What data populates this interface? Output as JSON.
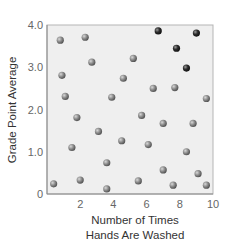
{
  "chart_data": {
    "type": "scatter",
    "title": "",
    "xlabel": "Number of Times Hands Are Washed",
    "xlabel_lines": [
      "Number of Times",
      "Hands Are Washed"
    ],
    "ylabel": "Grade Point Average",
    "xlim": [
      0,
      10
    ],
    "ylim": [
      0,
      4.0
    ],
    "x_ticks": [
      2,
      4,
      6,
      8,
      10
    ],
    "x_tick_labels": [
      "2",
      "4",
      "6",
      "8",
      "10"
    ],
    "y_ticks": [
      0,
      1.0,
      2.0,
      3.0,
      4.0
    ],
    "y_tick_labels": [
      "0",
      "1.0",
      "2.0",
      "3.0",
      "4.0"
    ],
    "grid": false,
    "legend": null,
    "colors": {
      "point": "#8a8a8a",
      "highlight_point": "#2e2e2e",
      "plot_background": "#efefef",
      "frame": "#b5b5b5"
    },
    "series": [
      {
        "name": "students",
        "points": [
          {
            "x": 0.8,
            "y": 3.64
          },
          {
            "x": 2.3,
            "y": 3.71
          },
          {
            "x": 2.7,
            "y": 3.12
          },
          {
            "x": 0.9,
            "y": 2.81
          },
          {
            "x": 5.2,
            "y": 3.21
          },
          {
            "x": 4.6,
            "y": 2.74
          },
          {
            "x": 6.4,
            "y": 2.5
          },
          {
            "x": 7.7,
            "y": 2.52
          },
          {
            "x": 1.1,
            "y": 2.31
          },
          {
            "x": 3.9,
            "y": 2.29
          },
          {
            "x": 1.8,
            "y": 1.81
          },
          {
            "x": 3.1,
            "y": 1.48
          },
          {
            "x": 4.5,
            "y": 1.26
          },
          {
            "x": 1.5,
            "y": 1.1
          },
          {
            "x": 3.6,
            "y": 0.74
          },
          {
            "x": 9.6,
            "y": 2.26
          },
          {
            "x": 5.7,
            "y": 1.86
          },
          {
            "x": 7.0,
            "y": 1.67
          },
          {
            "x": 8.8,
            "y": 1.67
          },
          {
            "x": 6.1,
            "y": 1.17
          },
          {
            "x": 8.4,
            "y": 1.0
          },
          {
            "x": 7.0,
            "y": 0.57
          },
          {
            "x": 9.1,
            "y": 0.48
          },
          {
            "x": 5.5,
            "y": 0.31
          },
          {
            "x": 7.6,
            "y": 0.21
          },
          {
            "x": 9.6,
            "y": 0.21
          },
          {
            "x": 0.4,
            "y": 0.24
          },
          {
            "x": 2.0,
            "y": 0.33
          },
          {
            "x": 3.6,
            "y": 0.12
          }
        ]
      },
      {
        "name": "highlighted",
        "points": [
          {
            "x": 6.7,
            "y": 3.86
          },
          {
            "x": 9.0,
            "y": 3.81
          },
          {
            "x": 7.8,
            "y": 3.45
          },
          {
            "x": 8.4,
            "y": 2.98
          }
        ]
      }
    ]
  }
}
